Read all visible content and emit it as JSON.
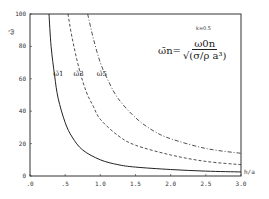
{
  "chart_data": {
    "type": "line",
    "title": "",
    "xlabel": "h/a",
    "ylabel": "ω̄",
    "xlim": [
      0.0,
      3.0
    ],
    "ylim": [
      0,
      100
    ],
    "grid": false,
    "x_ticks": [
      ".0",
      ".5",
      "1.0",
      "1.5",
      "2.0",
      "2.5",
      "3.0"
    ],
    "y_ticks": [
      "0",
      "20",
      "40",
      "60",
      "80",
      "100"
    ],
    "annotation": "k=0.5",
    "formula": {
      "lhs": "ω̄n=",
      "numerator": "ω0n",
      "denominator": "√(σ/ρ a³)"
    },
    "series": [
      {
        "name": "ω̄1",
        "style": "solid",
        "x": [
          0.27,
          0.3,
          0.35,
          0.4,
          0.5,
          0.6,
          0.75,
          1.0,
          1.25,
          1.5,
          2.0,
          2.5,
          3.0
        ],
        "y": [
          100,
          80,
          62,
          48,
          33,
          24,
          16,
          10,
          7,
          5.5,
          4,
          3,
          2.5
        ]
      },
      {
        "name": "ω̄3",
        "style": "dashed",
        "x": [
          0.54,
          0.6,
          0.7,
          0.8,
          0.9,
          1.0,
          1.25,
          1.5,
          2.0,
          2.5,
          3.0
        ],
        "y": [
          100,
          85,
          66,
          52,
          43,
          35,
          25,
          19,
          13,
          9,
          7
        ]
      },
      {
        "name": "ω̄5",
        "style": "dash-dot",
        "x": [
          0.82,
          0.9,
          1.0,
          1.1,
          1.25,
          1.5,
          1.75,
          2.0,
          2.5,
          3.0
        ],
        "y": [
          100,
          85,
          70,
          60,
          48,
          36,
          28,
          23,
          17,
          14
        ]
      }
    ],
    "curve_labels": [
      {
        "text": "ω̄1",
        "x": 0.33,
        "y": 62
      },
      {
        "text": "ω̄3",
        "x": 0.62,
        "y": 62
      },
      {
        "text": "ω̄5",
        "x": 0.95,
        "y": 62
      }
    ]
  }
}
